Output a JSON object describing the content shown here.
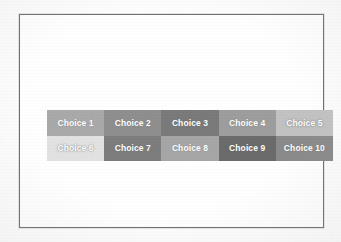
{
  "page": {
    "background_color": "#fdfdfd",
    "frame_border_color": "#6e6e6e",
    "frame_fill_color": "#ffffff"
  },
  "choice_grid": {
    "name": "choice-grid",
    "columns": 5,
    "rows": 2,
    "label_text_color": "#ffffff",
    "cells": [
      {
        "label": "Choice 1",
        "color": "#a9a9a9",
        "light": false
      },
      {
        "label": "Choice 2",
        "color": "#8e8e8e",
        "light": false
      },
      {
        "label": "Choice 3",
        "color": "#7a7a7a",
        "light": false
      },
      {
        "label": "Choice 4",
        "color": "#9d9d9d",
        "light": false
      },
      {
        "label": "Choice 5",
        "color": "#c2c2c2",
        "light": true
      },
      {
        "label": "Choice 6",
        "color": "#e2e2e2",
        "light": true
      },
      {
        "label": "Choice 7",
        "color": "#7d7d7d",
        "light": false
      },
      {
        "label": "Choice 8",
        "color": "#a6a6a6",
        "light": false
      },
      {
        "label": "Choice 9",
        "color": "#6b6b6b",
        "light": false
      },
      {
        "label": "Choice 10",
        "color": "#8a8a8a",
        "light": false
      }
    ]
  }
}
